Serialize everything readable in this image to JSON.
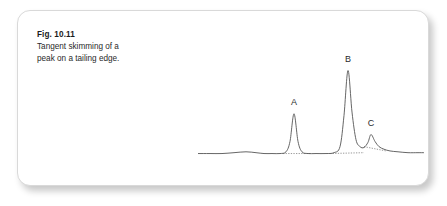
{
  "figure": {
    "caption_title": "Fig. 10.11",
    "caption_line1": "Tangent skimming of a",
    "caption_line2": "peak on a tailing edge.",
    "card_background": "#ffffff",
    "card_border_color": "#d9d9d9"
  },
  "chart_data": {
    "type": "line",
    "title": "Tangent skimming of a peak on a tailing edge.",
    "xlabel": "",
    "ylabel": "",
    "grid": false,
    "legend": false,
    "axes_visible": false,
    "trace_color": "#555555",
    "baseline_color": "#9a9a9a",
    "baseline_style": "dotted",
    "annotations": [
      {
        "label": "A",
        "x": 96,
        "y": 50,
        "label_x": 96,
        "label_y": 60
      },
      {
        "label": "B",
        "x": 150,
        "y": 100,
        "label_x": 150,
        "label_y": 110
      },
      {
        "label": "C",
        "x": 173,
        "y": 26,
        "label_x": 173,
        "label_y": 36
      }
    ],
    "peaks": [
      {
        "name": "A",
        "center": 96,
        "height": 50,
        "width": 9,
        "integration": "baseline-drop"
      },
      {
        "name": "B",
        "center": 150,
        "height": 100,
        "width": 8,
        "integration": "baseline-drop",
        "tailing": true
      },
      {
        "name": "C",
        "center": 173,
        "height": 26,
        "width": 7,
        "integration": "tangent-skim"
      }
    ],
    "x": [
      0,
      12,
      24,
      36,
      48,
      58,
      66,
      74,
      82,
      88,
      92,
      96,
      100,
      104,
      110,
      118,
      128,
      136,
      142,
      146,
      150,
      154,
      158,
      162,
      166,
      170,
      173,
      177,
      181,
      186,
      192,
      200,
      210,
      220,
      226
    ],
    "y": [
      4,
      4,
      4,
      5,
      6,
      5,
      4,
      4,
      4,
      6,
      18,
      50,
      18,
      6,
      4,
      4,
      4,
      5,
      12,
      48,
      100,
      52,
      20,
      12,
      11,
      17,
      26,
      18,
      12,
      9,
      7,
      6,
      5,
      5,
      5
    ],
    "baseline_segments": [
      {
        "name": "baseline-peak-a",
        "x0": 85,
        "y0": 4,
        "x1": 113,
        "y1": 4
      },
      {
        "name": "baseline-peak-b",
        "x0": 132,
        "y0": 4,
        "x1": 166,
        "y1": 5
      },
      {
        "name": "tangent-skim-peak-c",
        "x0": 166,
        "y0": 12,
        "x1": 188,
        "y1": 7
      }
    ],
    "xlim": [
      0,
      226
    ],
    "ylim": [
      0,
      118
    ]
  }
}
